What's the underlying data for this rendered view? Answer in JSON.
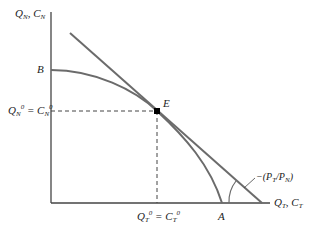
{
  "diagram": {
    "type": "production-possibility-frontier",
    "y_axis_label": {
      "main": "Q",
      "sub": "N",
      "sep": ", ",
      "main2": "C",
      "sub2": "N"
    },
    "x_axis_label": {
      "main": "Q",
      "sub": "T",
      "sep": ", ",
      "main2": "C",
      "sub2": "T"
    },
    "point_B": "B",
    "point_A": "A",
    "point_E": "E",
    "y_equilibrium_label": {
      "a": "Q",
      "a_sub": "N",
      "a_sup": "0",
      "eq": " = ",
      "b": "C",
      "b_sub": "N",
      "b_sup": "0"
    },
    "x_equilibrium_label": {
      "a": "Q",
      "a_sub": "T",
      "a_sup": "0",
      "eq": " = ",
      "b": "C",
      "b_sub": "T",
      "b_sup": "0"
    },
    "slope_label": {
      "prefix": "−(P",
      "s1": "T",
      "mid": "/P",
      "s2": "N",
      "suffix": ")"
    },
    "colors": {
      "curve": "#6b6b6b",
      "axis": "#444444",
      "point": "#000000",
      "dash": "#444444"
    }
  }
}
